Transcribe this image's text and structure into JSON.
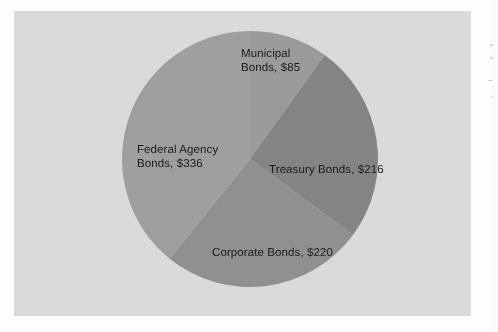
{
  "figure": {
    "background_color": "#fdfdfd",
    "plot_area_color": "#dcdcdc",
    "plot_border_color": "#bebebe"
  },
  "chart_data": {
    "type": "pie",
    "title": "",
    "subtitle": "",
    "xlabel": "",
    "ylabel": "",
    "grid": false,
    "legend_position": "none",
    "label_format": "{category}, ${value}",
    "start_angle_deg": 0,
    "direction": "clockwise",
    "total": 857,
    "currency_symbol": "$",
    "categories": [
      "Municipal Bonds",
      "Treasury Bonds",
      "Corporate Bonds",
      "Federal Agency Bonds"
    ],
    "values": [
      85,
      216,
      220,
      336
    ],
    "slices": [
      {
        "name": "municipal-bonds",
        "category": "Municipal Bonds",
        "value": 85,
        "value_label": "$85",
        "data_label": "Municipal\nBonds, $85",
        "data_label_line1": "Municipal",
        "data_label_line2": "Bonds, $85",
        "percent": 9.9,
        "angle_deg": 35.7,
        "start_deg": 0,
        "end_deg": 35.7,
        "color": "#9c9c9c"
      },
      {
        "name": "treasury-bonds",
        "category": "Treasury Bonds",
        "value": 216,
        "value_label": "$216",
        "data_label": "Treasury Bonds, $216",
        "percent": 25.2,
        "angle_deg": 90.7,
        "start_deg": 35.7,
        "end_deg": 126.4,
        "color": "#858585"
      },
      {
        "name": "corporate-bonds",
        "category": "Corporate Bonds",
        "value": 220,
        "value_label": "$220",
        "data_label": "Corporate Bonds, $220",
        "percent": 25.7,
        "angle_deg": 92.4,
        "start_deg": 126.4,
        "end_deg": 218.8,
        "color": "#919191"
      },
      {
        "name": "federal-agency-bonds",
        "category": "Federal Agency Bonds",
        "value": 336,
        "value_label": "$336",
        "data_label": "Federal Agency\nBonds, $336",
        "data_label_line1": "Federal Agency",
        "data_label_line2": "Bonds, $336",
        "percent": 39.2,
        "angle_deg": 141.2,
        "start_deg": 218.8,
        "end_deg": 360,
        "color": "#a0a0a0"
      }
    ]
  }
}
